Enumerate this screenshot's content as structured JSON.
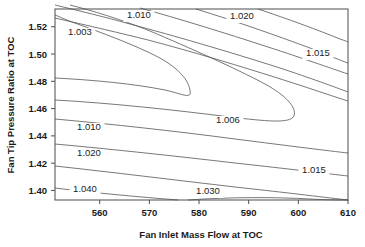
{
  "chart_data": {
    "type": "line",
    "subtype": "contour",
    "title": "",
    "xlabel": "Fan Inlet Mass Flow at TOC",
    "ylabel": "Fan Tip Pressure Ratio at TOC",
    "xlim": [
      551,
      610
    ],
    "ylim": [
      1.393,
      1.533
    ],
    "xticks": [
      560,
      570,
      580,
      590,
      600,
      610
    ],
    "xtick_labels": [
      "560",
      "570",
      "580",
      "590",
      "600",
      "610"
    ],
    "yticks": [
      1.4,
      1.42,
      1.44,
      1.46,
      1.48,
      1.5,
      1.52
    ],
    "ytick_labels": [
      "1.40",
      "1.42",
      "1.44",
      "1.46",
      "1.48",
      "1.50",
      "1.52"
    ],
    "grid": false,
    "legend": "none",
    "contour_levels": [
      1.003,
      1.006,
      1.01,
      1.015,
      1.02,
      1.03,
      1.04
    ],
    "contour_labels": [
      {
        "level": 1.003,
        "text": "1.003",
        "x_px": 80,
        "y_px": 35
      },
      {
        "level": 1.01,
        "text": "1.010",
        "x_px": 139,
        "y_px": 18
      },
      {
        "level": 1.02,
        "text": "1.020",
        "x_px": 242,
        "y_px": 19
      },
      {
        "level": 1.015,
        "text": "1.015",
        "x_px": 318,
        "y_px": 56
      },
      {
        "level": 1.006,
        "text": "1.006",
        "x_px": 228,
        "y_px": 123
      },
      {
        "level": 1.01,
        "text": "1.010",
        "x_px": 89,
        "y_px": 130
      },
      {
        "level": 1.02,
        "text": "1.020",
        "x_px": 89,
        "y_px": 156
      },
      {
        "level": 1.015,
        "text": "1.015",
        "x_px": 314,
        "y_px": 173
      },
      {
        "level": 1.04,
        "text": "1.040",
        "x_px": 85,
        "y_px": 192
      },
      {
        "level": 1.03,
        "text": "1.030",
        "x_px": 208,
        "y_px": 194
      }
    ],
    "contour_paths": [
      {
        "level": 1.01,
        "d": "M 55 18 C 90 26, 120 33, 148 40 C 190 51, 240 66, 290 82 C 315 90, 335 97, 348 101"
      },
      {
        "level": 1.02,
        "d": "M 55 5 C 80 11, 105 17, 130 24 C 175 36, 230 52, 280 68 C 310 78, 335 87, 348 92"
      },
      {
        "level": 1.02,
        "d": "M 140 8 C 180 19, 225 33, 268 47 C 302 58, 330 68, 348 74"
      },
      {
        "level": 1.015,
        "d": "M 196 9 C 235 21, 275 35, 310 48 C 330 56, 342 61, 348 63"
      },
      {
        "level": 1.015,
        "d": "M 258 9 C 288 19, 318 30, 340 39 C 346 41, 348 42, 348 42"
      },
      {
        "level": 1.003,
        "d": "M 55 78 C 95 80, 135 84, 165 90 C 183 94, 192 100, 190 90 C 188 78, 175 66, 158 57 C 135 45, 100 32, 72 22 C 64 19, 58 16, 55 15"
      },
      {
        "level": 1.006,
        "d": "M 55 100 C 110 103, 175 110, 230 117 C 265 121, 290 124, 294 116 C 297 107, 285 95, 265 84 C 235 68, 190 48, 150 31 C 120 19, 90 10, 70 5"
      },
      {
        "level": 1.01,
        "d": "M 55 119 C 110 124, 175 131, 235 139 C 290 146, 330 151, 348 153"
      },
      {
        "level": 1.02,
        "d": "M 55 144 C 110 149, 175 156, 235 163 C 290 169, 330 174, 348 176"
      },
      {
        "level": 1.03,
        "d": "M 55 166 C 110 172, 175 180, 235 187 C 290 193, 330 198, 348 200"
      },
      {
        "level": 1.04,
        "d": "M 55 188 C 95 193, 140 197, 178 200"
      },
      {
        "level": 1.04,
        "d": "M 188 200 C 230 197, 275 197, 310 199 C 330 200, 344 200, 348 200"
      }
    ]
  },
  "plot_frame": {
    "left_px": 55,
    "top_px": 9,
    "right_px": 348,
    "bottom_px": 200
  }
}
